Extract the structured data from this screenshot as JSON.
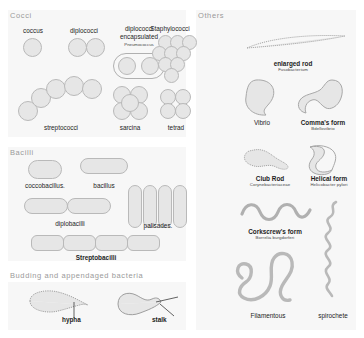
{
  "figure": {
    "background": "#ffffff",
    "panel_fill": "#f7f7f7",
    "cell_fill": "#e6e6e6",
    "cell_stroke": "#b9b9b9",
    "header_color": "#9a9a9a"
  },
  "sections": {
    "cocci": {
      "header": "Cocci"
    },
    "bacilli": {
      "header": "Bacilli"
    },
    "budding": {
      "header": "Budding and appendaged bacteria"
    },
    "others": {
      "header": "Others"
    }
  },
  "cocci_items": [
    {
      "label": "coccus",
      "sub": ""
    },
    {
      "label": "diplococci",
      "sub": ""
    },
    {
      "label": "diplococci encapsulated",
      "line1": "diplococci",
      "line2": "encapsulated",
      "sub": "Pneumococcus"
    },
    {
      "label": "Staphylococci",
      "sub": ""
    },
    {
      "label": "streptococci",
      "sub": ""
    },
    {
      "label": "sarcina",
      "sub": ""
    },
    {
      "label": "tetrad",
      "sub": ""
    }
  ],
  "bacilli_items": [
    {
      "label": "coccobacillus.",
      "sub": ""
    },
    {
      "label": "bacillus",
      "sub": ""
    },
    {
      "label": "diplobacilli",
      "sub": ""
    },
    {
      "label": "palisades.",
      "sub": ""
    },
    {
      "label": "Streptobacilli",
      "sub": ""
    }
  ],
  "budding_items": [
    {
      "label": "hypha",
      "sub": ""
    },
    {
      "label": "stalk",
      "sub": ""
    }
  ],
  "others_items": [
    {
      "label": "enlarged rod",
      "sub": "Fusobacterium"
    },
    {
      "label": "Vibrio",
      "sub": ""
    },
    {
      "label": "Comma's form",
      "sub": "Bdellovibrio"
    },
    {
      "label": "Club Rod",
      "sub": "Corynebacteriaceae"
    },
    {
      "label": "Helical form",
      "sub": "Helicobacter pylori"
    },
    {
      "label": "Corkscrew's form",
      "sub": "Borrelia burgdorferi"
    },
    {
      "label": "Filamentous",
      "sub": ""
    },
    {
      "label": "spirochete",
      "sub": ""
    }
  ]
}
